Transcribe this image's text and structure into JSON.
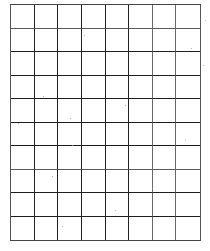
{
  "grid": {
    "columns": 8,
    "rows": 10,
    "line_color": "#222222",
    "background_color": "#ffffff",
    "lighter_vertical_lines": [
      5,
      6
    ],
    "lighter_horizontal_lines": [
      0,
      6
    ]
  }
}
